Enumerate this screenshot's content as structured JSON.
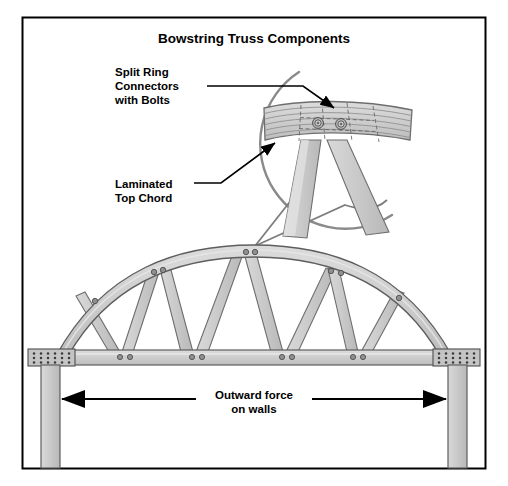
{
  "figure": {
    "title": "Bowstring Truss Components",
    "background_color": "#ffffff",
    "frame_color": "#000000",
    "wood_fill": "#c9c9c9",
    "wood_fill_light": "#d8d8d8",
    "wood_edge": "#6e6e6e",
    "bolt_color": "#8a8a8a",
    "bolt_edge": "#5a5a5a",
    "leader_color": "#000000",
    "detail_circle_color": "#8a8a8a"
  },
  "callouts": [
    {
      "id": "split-ring",
      "lines": [
        "Split Ring",
        "Connectors",
        "with Bolts"
      ],
      "text": "Split Ring Connectors with Bolts",
      "line1": "Split Ring",
      "line2": "Connectors",
      "line3": "with Bolts"
    },
    {
      "id": "laminated-top-chord",
      "lines": [
        "Laminated",
        "Top Chord"
      ],
      "text": "Laminated Top Chord",
      "line1": "Laminated",
      "line2": "Top Chord"
    }
  ],
  "force_annotation": {
    "line1": "Outward force",
    "line2": "on walls",
    "text": "Outward force on walls",
    "direction": "bidirectional-horizontal"
  },
  "truss": {
    "type": "bowstring",
    "span_px": 400,
    "rise_px": 100,
    "web_member_count": 8,
    "top_chord": "arched laminated",
    "bottom_chord": "horizontal tie beam",
    "bearing_plate_bolt_grid": {
      "columns": 6,
      "rows": 3
    },
    "bottom_chord_joint_bolt_pairs": 4,
    "top_chord_joint_bolts": [
      2,
      2,
      2,
      2,
      1,
      1
    ],
    "apex_bolts": 2,
    "walls": 2
  },
  "detail_view": {
    "shape": "partial circle",
    "shows": "apex connection of laminated top chord with two web members",
    "laminate_layer_count": 6,
    "split_ring_bolt_count": 2
  }
}
